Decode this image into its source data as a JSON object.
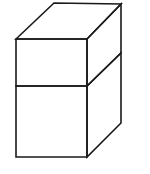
{
  "diagram": {
    "type": "isometric-box",
    "stroke_color": "#1a1a1a",
    "background_color": "#ffffff",
    "stroke_width": 1.6,
    "vertices": {
      "front_top_left": [
        16,
        39
      ],
      "front_top_right": [
        87,
        39
      ],
      "front_mid_left": [
        16,
        86
      ],
      "front_mid_right": [
        87,
        86
      ],
      "front_bottom_left": [
        16,
        157
      ],
      "front_bottom_right": [
        87,
        157
      ],
      "back_top_left": [
        54,
        3
      ],
      "back_top_right": [
        121,
        4
      ],
      "back_mid_right": [
        121,
        53
      ],
      "back_bottom_right": [
        121,
        123
      ]
    },
    "blocks": [
      {
        "name": "upper-block",
        "front_height": 47
      },
      {
        "name": "lower-block",
        "front_height": 71
      }
    ]
  }
}
